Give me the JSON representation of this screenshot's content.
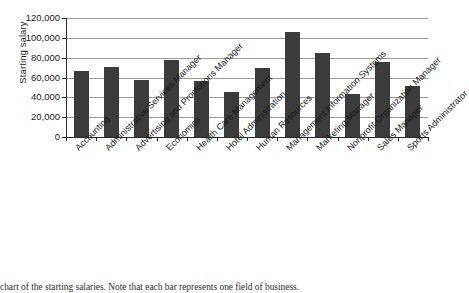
{
  "chart_data": {
    "type": "bar",
    "title": "",
    "xlabel": "",
    "ylabel": "Starting salary",
    "ylim": [
      0,
      120000
    ],
    "ytick_labels": [
      "120,000",
      "100,000",
      "80,000",
      "60,000",
      "40,000",
      "20,000",
      "0"
    ],
    "ytick_values": [
      120000,
      100000,
      80000,
      60000,
      40000,
      20000,
      0
    ],
    "grid": true,
    "legend": "none",
    "categories": [
      "Accounting",
      "Administrative Services Manager",
      "Advertising and Promotions Manager",
      "Economics",
      "Health Care Management",
      "Hotel Administration",
      "Human Resources",
      "Management Information Systems",
      "Marketing Manager",
      "Nonprofit Organization Manager",
      "Sales Manager",
      "Sports Administrator"
    ],
    "values": [
      67000,
      71000,
      57000,
      78000,
      56000,
      45000,
      70000,
      106000,
      85000,
      43000,
      76000,
      51000
    ],
    "bar_color": "#3b3b3b",
    "gridline_color": "#9a9a9a",
    "axis_color": "#2a2a2a"
  },
  "caption": {
    "text": "chart of the starting salaries. Note that each bar represents one field of business."
  }
}
